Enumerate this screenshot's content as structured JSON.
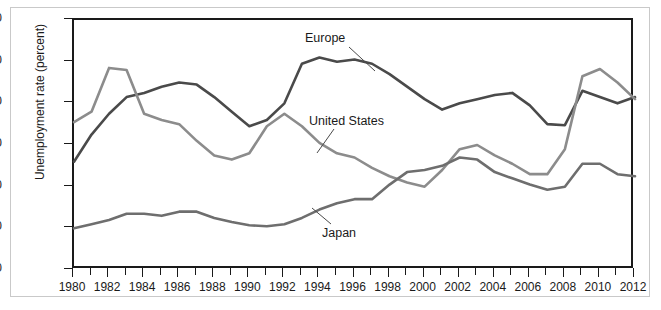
{
  "chart_data": {
    "type": "line",
    "title": "",
    "xlabel": "",
    "ylabel": "Unemployment rate (percent)",
    "xlim": [
      1980,
      2012
    ],
    "ylim": [
      0.0,
      12.0
    ],
    "ytick_labels": [
      "0.0",
      "2.0",
      "4.0",
      "6.0",
      "8.0",
      "10.0",
      "12.0"
    ],
    "ytick_values": [
      0.0,
      2.0,
      4.0,
      6.0,
      8.0,
      10.0,
      12.0
    ],
    "xtick_labels": [
      "1980",
      "1982",
      "1984",
      "1986",
      "1988",
      "1990",
      "1992",
      "1994",
      "1996",
      "1998",
      "2000",
      "2002",
      "2004",
      "2006",
      "2008",
      "2010",
      "2012"
    ],
    "xtick_values": [
      1980,
      1982,
      1984,
      1986,
      1988,
      1990,
      1992,
      1994,
      1996,
      1998,
      2000,
      2002,
      2004,
      2006,
      2008,
      2010,
      2012
    ],
    "minor_xticks_every": 1,
    "grid": false,
    "legend": "inline-annotations",
    "x": [
      1980,
      1981,
      1982,
      1983,
      1984,
      1985,
      1986,
      1987,
      1988,
      1989,
      1990,
      1991,
      1992,
      1993,
      1994,
      1995,
      1996,
      1997,
      1998,
      1999,
      2000,
      2001,
      2002,
      2003,
      2004,
      2005,
      2006,
      2007,
      2008,
      2009,
      2010,
      2011,
      2012
    ],
    "series": [
      {
        "name": "Europe",
        "color": "#4a4a4a",
        "width": 2.6,
        "values": [
          5.2,
          6.5,
          7.5,
          8.3,
          8.5,
          8.8,
          9.0,
          8.9,
          8.3,
          7.6,
          6.9,
          7.2,
          8.0,
          9.9,
          10.2,
          10.0,
          10.1,
          9.9,
          9.4,
          8.8,
          8.2,
          7.7,
          8.0,
          8.2,
          8.4,
          8.5,
          7.9,
          7.0,
          6.95,
          8.6,
          8.3,
          8.0,
          8.3
        ]
      },
      {
        "name": "United States",
        "color": "#8c8c8c",
        "width": 2.6,
        "values": [
          7.1,
          7.6,
          9.7,
          9.6,
          7.5,
          7.2,
          7.0,
          6.2,
          5.5,
          5.3,
          5.6,
          6.9,
          7.5,
          6.9,
          6.1,
          5.6,
          5.4,
          4.9,
          4.5,
          4.2,
          4.0,
          4.8,
          5.8,
          6.0,
          5.5,
          5.1,
          4.6,
          4.6,
          5.8,
          9.3,
          9.65,
          9.0,
          8.2
        ]
      },
      {
        "name": "Japan",
        "color": "#6e6e6e",
        "width": 2.6,
        "values": [
          2.0,
          2.2,
          2.4,
          2.7,
          2.7,
          2.6,
          2.8,
          2.8,
          2.5,
          2.3,
          2.15,
          2.1,
          2.2,
          2.5,
          2.9,
          3.2,
          3.4,
          3.4,
          4.1,
          4.7,
          4.8,
          5.0,
          5.4,
          5.3,
          4.7,
          4.4,
          4.1,
          3.85,
          4.0,
          5.1,
          5.1,
          4.6,
          4.5
        ]
      }
    ],
    "annotations": [
      {
        "text": "Europe",
        "label_x": 305,
        "label_y": 31,
        "leader": [
          348,
          46,
          374,
          70
        ]
      },
      {
        "text": "United States",
        "label_x": 309,
        "label_y": 114,
        "leader": [
          333,
          128,
          316,
          152
        ]
      },
      {
        "text": "Japan",
        "label_x": 322,
        "label_y": 226,
        "leader": [
          330,
          223,
          311,
          207
        ]
      }
    ]
  }
}
